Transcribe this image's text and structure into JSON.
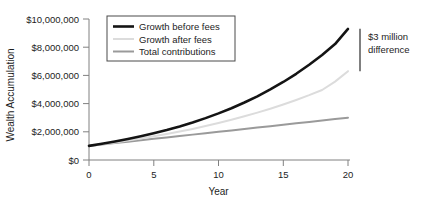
{
  "chart_data": {
    "type": "line",
    "title": "",
    "xlabel": "Year",
    "ylabel": "Wealth Accumulation",
    "xlim": [
      0,
      20
    ],
    "ylim": [
      0,
      10000000
    ],
    "grid": false,
    "legend_position": "top-left-inside",
    "x_ticks": [
      0,
      5,
      10,
      15,
      20
    ],
    "x_tick_labels": [
      "0",
      "5",
      "10",
      "15",
      "20"
    ],
    "y_ticks": [
      0,
      2000000,
      4000000,
      6000000,
      8000000,
      10000000
    ],
    "y_tick_labels": [
      "$0",
      "$2,000,000",
      "$4,000,000",
      "$6,000,000",
      "$8,000,000",
      "$10,000,000"
    ],
    "x": [
      0,
      1,
      2,
      3,
      4,
      5,
      6,
      7,
      8,
      9,
      10,
      11,
      12,
      13,
      14,
      15,
      16,
      17,
      18,
      19,
      20
    ],
    "series": [
      {
        "name": "Growth before fees",
        "color": "#141414",
        "width": 2.6,
        "values": [
          1000000,
          1148000,
          1310000,
          1487000,
          1681000,
          1894000,
          2127000,
          2382000,
          2662000,
          2969000,
          3305000,
          3673000,
          4076000,
          4518000,
          5002000,
          5533000,
          6115000,
          6753000,
          7452000,
          8219000,
          9300000
        ]
      },
      {
        "name": "Growth after fees",
        "color": "#dcdcdc",
        "width": 2.0,
        "values": [
          1000000,
          1118000,
          1244000,
          1379000,
          1523000,
          1677000,
          1842000,
          2018000,
          2206000,
          2407000,
          2622000,
          2852000,
          3097000,
          3359000,
          3639000,
          3938000,
          4258000,
          4599000,
          4964000,
          5560000,
          6300000
        ]
      },
      {
        "name": "Total contributions",
        "color": "#9a9a9a",
        "width": 2.0,
        "values": [
          1000000,
          1100000,
          1200000,
          1300000,
          1400000,
          1500000,
          1600000,
          1700000,
          1800000,
          1900000,
          2000000,
          2100000,
          2200000,
          2300000,
          2400000,
          2500000,
          2600000,
          2700000,
          2800000,
          2900000,
          3000000
        ]
      }
    ],
    "annotations": [
      {
        "name": "difference-bracket",
        "text_line1": "$3 million",
        "text_line2": "difference",
        "x_value": 20,
        "y_top": 9300000,
        "y_bottom": 6300000
      }
    ]
  }
}
